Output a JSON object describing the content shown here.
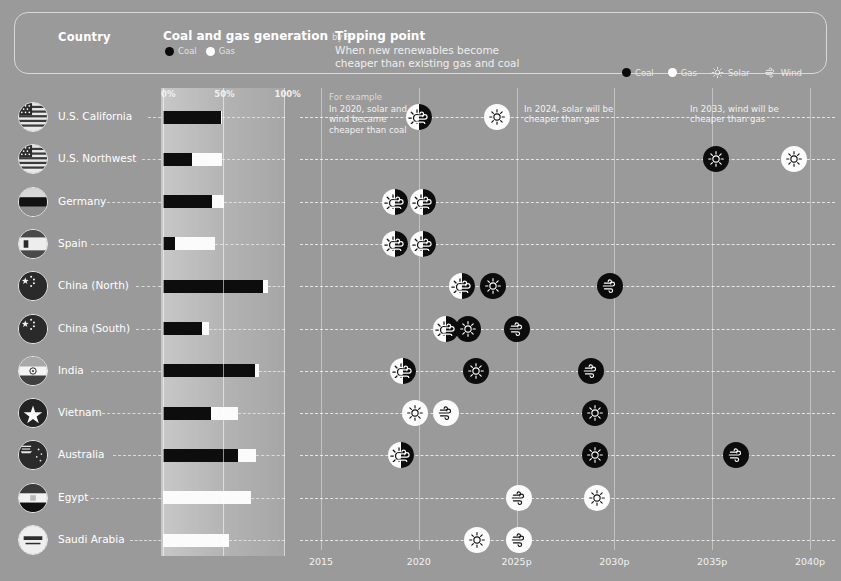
{
  "header": {
    "country_label": "Country",
    "generation_title": "Coal and gas generation",
    "generation_sub": "by %",
    "legend_coal": "Coal",
    "legend_gas": "Gas",
    "tipping_title": "Tipping point",
    "tipping_line1": "When new renewables become",
    "tipping_line2": "cheaper than existing gas and coal",
    "right_legend": [
      {
        "label": "Coal",
        "icon": "coal-dot-icon"
      },
      {
        "label": "Gas",
        "icon": "gas-dot-icon"
      },
      {
        "label": "Solar",
        "icon": "solar-icon"
      },
      {
        "label": "Wind",
        "icon": "wind-icon"
      }
    ]
  },
  "bar_axis": {
    "ticks": [
      "0%",
      "50%",
      "100%"
    ],
    "tick_values": [
      0,
      50,
      100
    ]
  },
  "timeline_axis": {
    "ticks": [
      "2015",
      "2020",
      "2025p",
      "2030p",
      "2035p",
      "2040p"
    ],
    "tick_values": [
      2015,
      2020,
      2025,
      2030,
      2035,
      2040
    ]
  },
  "annotations": {
    "example_label": "For example",
    "example_text": "In 2020, solar and wind became cheaper than coal",
    "note_2024": "In 2024, solar will be cheaper than gas",
    "note_2033": "In 2033, wind will be cheaper than gas"
  },
  "chart_data": {
    "type": "bar",
    "xlabel": "",
    "ylabel": "Country",
    "xlim": [
      0,
      100
    ],
    "grid": true,
    "categories": [
      "U.S. California",
      "U.S. Northwest",
      "Germany",
      "Spain",
      "China (North)",
      "China (South)",
      "India",
      "Vietnam",
      "Australia",
      "Egypt",
      "Saudi Arabia"
    ],
    "series": [
      {
        "name": "Coal",
        "values": [
          48,
          24,
          41,
          10,
          83,
          32,
          76,
          40,
          62,
          0,
          0
        ]
      },
      {
        "name": "Gas",
        "values": [
          1,
          25,
          10,
          33,
          4,
          6,
          4,
          22,
          15,
          73,
          55
        ]
      }
    ],
    "tipping_points": [
      {
        "country": "U.S. California",
        "markers": [
          {
            "year": 2020.0,
            "fuel": "coal",
            "tech": "solar+wind"
          },
          {
            "year": 2024.0,
            "fuel": "gas",
            "tech": "solar"
          }
        ]
      },
      {
        "country": "U.S. Northwest",
        "markers": [
          {
            "year": 2035.2,
            "fuel": "coal",
            "tech": "solar"
          },
          {
            "year": 2039.2,
            "fuel": "gas",
            "tech": "solar"
          }
        ]
      },
      {
        "country": "Germany",
        "markers": [
          {
            "year": 2018.8,
            "fuel": "gas",
            "tech": "solar+wind"
          },
          {
            "year": 2020.2,
            "fuel": "coal",
            "tech": "solar+wind"
          }
        ]
      },
      {
        "country": "Spain",
        "markers": [
          {
            "year": 2018.8,
            "fuel": "gas",
            "tech": "solar+wind"
          },
          {
            "year": 2020.2,
            "fuel": "coal",
            "tech": "solar+wind"
          }
        ]
      },
      {
        "country": "China (North)",
        "markers": [
          {
            "year": 2022.2,
            "fuel": "gas",
            "tech": "solar+wind"
          },
          {
            "year": 2023.8,
            "fuel": "coal",
            "tech": "solar"
          },
          {
            "year": 2029.8,
            "fuel": "coal",
            "tech": "wind"
          }
        ]
      },
      {
        "country": "China (South)",
        "markers": [
          {
            "year": 2021.4,
            "fuel": "gas",
            "tech": "solar+wind"
          },
          {
            "year": 2022.5,
            "fuel": "coal",
            "tech": "solar"
          },
          {
            "year": 2025.0,
            "fuel": "coal",
            "tech": "wind"
          }
        ]
      },
      {
        "country": "India",
        "markers": [
          {
            "year": 2019.2,
            "fuel": "gas",
            "tech": "solar+wind"
          },
          {
            "year": 2022.9,
            "fuel": "coal",
            "tech": "solar"
          },
          {
            "year": 2028.8,
            "fuel": "coal",
            "tech": "wind"
          }
        ]
      },
      {
        "country": "Vietnam",
        "markers": [
          {
            "year": 2019.8,
            "fuel": "gas",
            "tech": "solar"
          },
          {
            "year": 2021.4,
            "fuel": "gas",
            "tech": "wind"
          },
          {
            "year": 2029.0,
            "fuel": "coal",
            "tech": "solar"
          }
        ]
      },
      {
        "country": "Australia",
        "markers": [
          {
            "year": 2019.1,
            "fuel": "gas",
            "tech": "solar+wind"
          },
          {
            "year": 2029.0,
            "fuel": "coal",
            "tech": "solar"
          },
          {
            "year": 2036.2,
            "fuel": "coal",
            "tech": "wind"
          }
        ]
      },
      {
        "country": "Egypt",
        "markers": [
          {
            "year": 2025.1,
            "fuel": "gas",
            "tech": "wind"
          },
          {
            "year": 2029.1,
            "fuel": "gas",
            "tech": "solar"
          }
        ]
      },
      {
        "country": "Saudi Arabia",
        "markers": [
          {
            "year": 2023.0,
            "fuel": "gas",
            "tech": "solar"
          },
          {
            "year": 2025.1,
            "fuel": "gas",
            "tech": "wind"
          }
        ]
      }
    ]
  },
  "colors": {
    "background": "#9a9a9a",
    "coal": "#0c0c0c",
    "gas": "#fcfcfc",
    "text": "#ffffff",
    "panel_light": "#c8c8c8",
    "panel_dark": "#a6a6a6"
  }
}
